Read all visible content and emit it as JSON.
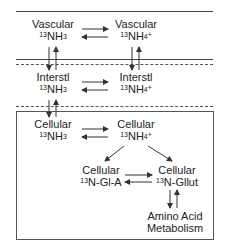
{
  "diagram": {
    "compartments": {
      "vascular": {
        "left_title": "Vascular",
        "left_species": "NH",
        "left_sub": "3",
        "right_title": "Vascular",
        "right_species": "NH",
        "right_sub": "4",
        "right_charge": "+"
      },
      "interstitial": {
        "left_title": "Interstl",
        "left_species": "NH",
        "left_sub": "3",
        "right_title": "Interstl",
        "right_species": "NH",
        "right_sub": "4",
        "right_charge": "+"
      },
      "cellular": {
        "left_title": "Cellular",
        "left_species": "NH",
        "left_sub": "3",
        "right_title": "Cellular",
        "right_species": "NH",
        "right_sub": "4",
        "right_charge": "+"
      }
    },
    "isotope": "13",
    "metabolites": {
      "glutamine": {
        "title": "Cellular",
        "species": "N-Gl-A"
      },
      "glutamate": {
        "title": "Cellular",
        "species": "N-Gllut"
      }
    },
    "amino_acid": {
      "line1": "Amino Acid",
      "line2": "Metabolism"
    },
    "colors": {
      "line": "#444444",
      "text": "#222222",
      "background": "#ffffff"
    }
  }
}
